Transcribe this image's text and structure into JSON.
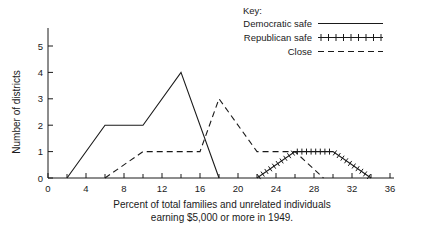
{
  "chart_data": {
    "type": "line",
    "title": "",
    "xlabel": "Percent of total families and unrelated individuals earning $5,000 or more in 1949.",
    "xlabel_line1": "Percent of total families and unrelated individuals",
    "xlabel_line2": "earning $5,000 or more in 1949.",
    "ylabel": "Number of districts",
    "xlim": [
      0,
      36
    ],
    "ylim": [
      0,
      5
    ],
    "grid": false,
    "x_major_ticks": [
      0,
      4,
      8,
      12,
      16,
      20,
      24,
      28,
      32,
      36
    ],
    "x_minor_ticks": [
      2,
      6,
      10,
      14,
      18,
      22,
      26,
      30,
      34
    ],
    "x_tick_labels": [
      "0",
      "4",
      "8",
      "12",
      "16",
      "20",
      "24",
      "28",
      "32",
      "36"
    ],
    "y_ticks": [
      0,
      1,
      2,
      3,
      4,
      5
    ],
    "y_tick_labels": [
      "0",
      "1",
      "2",
      "3",
      "4",
      "5"
    ],
    "legend_position": "top-right",
    "legend_title": "Key:",
    "series": [
      {
        "name": "Democratic safe",
        "style": "solid",
        "x": [
          2,
          6,
          10,
          14,
          18
        ],
        "y": [
          0,
          2,
          2,
          4,
          0
        ]
      },
      {
        "name": "Republican safe",
        "style": "plus-hatched",
        "x": [
          22,
          26,
          30,
          34
        ],
        "y": [
          0,
          1,
          1,
          0
        ]
      },
      {
        "name": "Close",
        "style": "dashed",
        "x": [
          6,
          10,
          16,
          18,
          22,
          26,
          29
        ],
        "y": [
          0,
          1,
          1,
          3,
          1,
          1,
          0
        ]
      }
    ]
  },
  "legend": {
    "title": "Key:",
    "items": [
      {
        "label": "Democratic safe",
        "style": "solid"
      },
      {
        "label": "Republican safe",
        "style": "plus-hatched"
      },
      {
        "label": "Close",
        "style": "dashed"
      }
    ]
  },
  "axes": {
    "y_title": "Number of districts",
    "x_title_line1": "Percent of total families and unrelated individuals",
    "x_title_line2": "earning $5,000 or more in 1949.",
    "y_labels": [
      "0",
      "1",
      "2",
      "3",
      "4",
      "5"
    ],
    "x_labels": [
      "0",
      "4",
      "8",
      "12",
      "16",
      "20",
      "24",
      "28",
      "32",
      "36"
    ],
    "origin_label": "0"
  },
  "colors": {
    "ink": "#1a1a1a",
    "background": "#ffffff"
  }
}
